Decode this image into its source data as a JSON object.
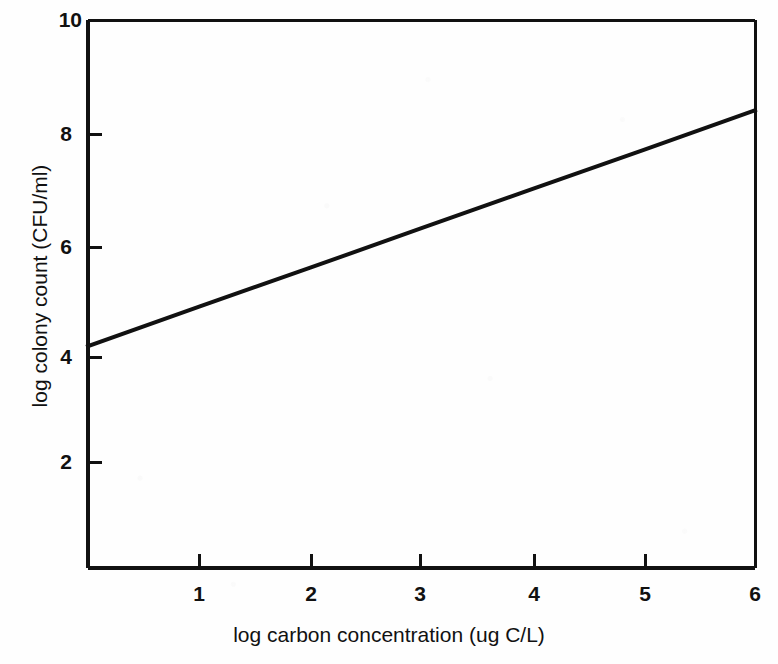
{
  "chart_data": {
    "type": "line",
    "title": "",
    "xlabel": "log carbon concentration (ug C/L)",
    "ylabel": "log colony count (CFU/ml)",
    "xlim": [
      0,
      6
    ],
    "ylim": [
      0,
      10
    ],
    "xticks": [
      1,
      2,
      3,
      4,
      5,
      6
    ],
    "xtick_labels": [
      "1",
      "2",
      "3",
      "4",
      "5",
      "6"
    ],
    "yticks": [
      2,
      4,
      6,
      8,
      10
    ],
    "ytick_labels": [
      "2",
      "4",
      "6",
      "8",
      "10"
    ],
    "grid": false,
    "legend": false,
    "legend_position": "none",
    "series": [
      {
        "name": "log colony count",
        "x": [
          0,
          1,
          2,
          3,
          4,
          5,
          6
        ],
        "values": [
          4.05,
          4.77,
          5.48,
          6.2,
          6.92,
          7.63,
          8.35
        ],
        "color": "#111111",
        "line_width": 4,
        "style": "solid",
        "markers": "none",
        "slope": 0.717,
        "intercept": 4.05
      }
    ],
    "annotations": []
  },
  "axes": {
    "y_tick_labels": {
      "t10": "10",
      "t8": "8",
      "t6": "6",
      "t4": "4",
      "t2": "2"
    },
    "x_tick_labels": {
      "t1": "1",
      "t2": "2",
      "t3": "3",
      "t4": "4",
      "t5": "5",
      "t6": "6"
    },
    "x_title": "log carbon concentration (ug C/L)",
    "y_title": "log colony count (CFU/ml)"
  },
  "style": {
    "axis_color": "#111111",
    "line_color": "#111111",
    "background": "#ffffff"
  }
}
